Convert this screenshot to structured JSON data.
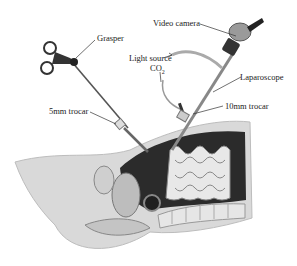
{
  "figure": {
    "labels": {
      "grasper": "Grasper",
      "video_camera": "Video camera",
      "light_source": "Light source",
      "co2": "CO",
      "co2_sub": "2",
      "laparoscope": "Laparoscope",
      "trocar_5mm": "5mm trocar",
      "trocar_10mm": "10mm trocar"
    }
  }
}
